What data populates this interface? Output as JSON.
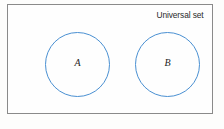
{
  "diagram": {
    "type": "venn-diagram",
    "universal_set": {
      "label": "Universal set",
      "border_color": "#8a8a8a",
      "fill_color": "#fefefe"
    },
    "sets": [
      {
        "id": "a",
        "label": "A",
        "stroke_color": "#4a90d2",
        "fill_color": "none"
      },
      {
        "id": "b",
        "label": "B",
        "stroke_color": "#4a90d2",
        "fill_color": "none"
      }
    ],
    "relationship": "disjoint",
    "intersection_label": ""
  },
  "chart_data": {
    "type": "diagram",
    "title": "",
    "categories": [
      "A",
      "B"
    ],
    "values": [
      1,
      1
    ],
    "annotations": [
      "Universal set",
      "A",
      "B"
    ],
    "legend": []
  }
}
